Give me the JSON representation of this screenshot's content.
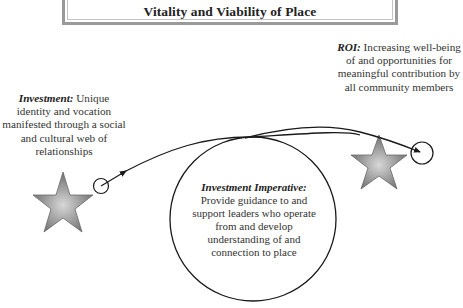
{
  "title": "Vitality and Viability of Place",
  "investment": {
    "heading": "Investment:",
    "text": " Unique identity and vocation manifested through a social and cultural web of relationships"
  },
  "roi": {
    "heading": "ROI:",
    "text": " Increasing well-being of and opportunities for meaningful contribution by all community members"
  },
  "imperative": {
    "heading": "Investment Imperative:",
    "text": "Provide guidance to and support leaders who operate from and develop understanding of and connection to place"
  },
  "icons": {
    "left_star": "star-icon",
    "right_star": "star-icon",
    "left_circle": "circle-node",
    "right_circle": "circle-node",
    "arrow": "curved-arrow"
  },
  "colors": {
    "star_outer": "#7a7a7a",
    "star_inner": "#cfcfcf",
    "line": "#1a1a1a",
    "frame": "#9a9a9a"
  }
}
